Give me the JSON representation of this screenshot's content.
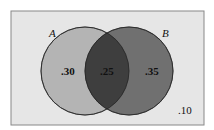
{
  "diagram": {
    "type": "venn",
    "sets": [
      {
        "name": "A",
        "label": "A",
        "only_value": ".30",
        "color": "#b4b4b4"
      },
      {
        "name": "B",
        "label": "B",
        "only_value": ".35",
        "color": "#707070"
      }
    ],
    "intersection": {
      "value": ".25",
      "color": "#3e3e3e"
    },
    "outside": {
      "value": ".10"
    },
    "frame_color": "#e6e6e6"
  }
}
